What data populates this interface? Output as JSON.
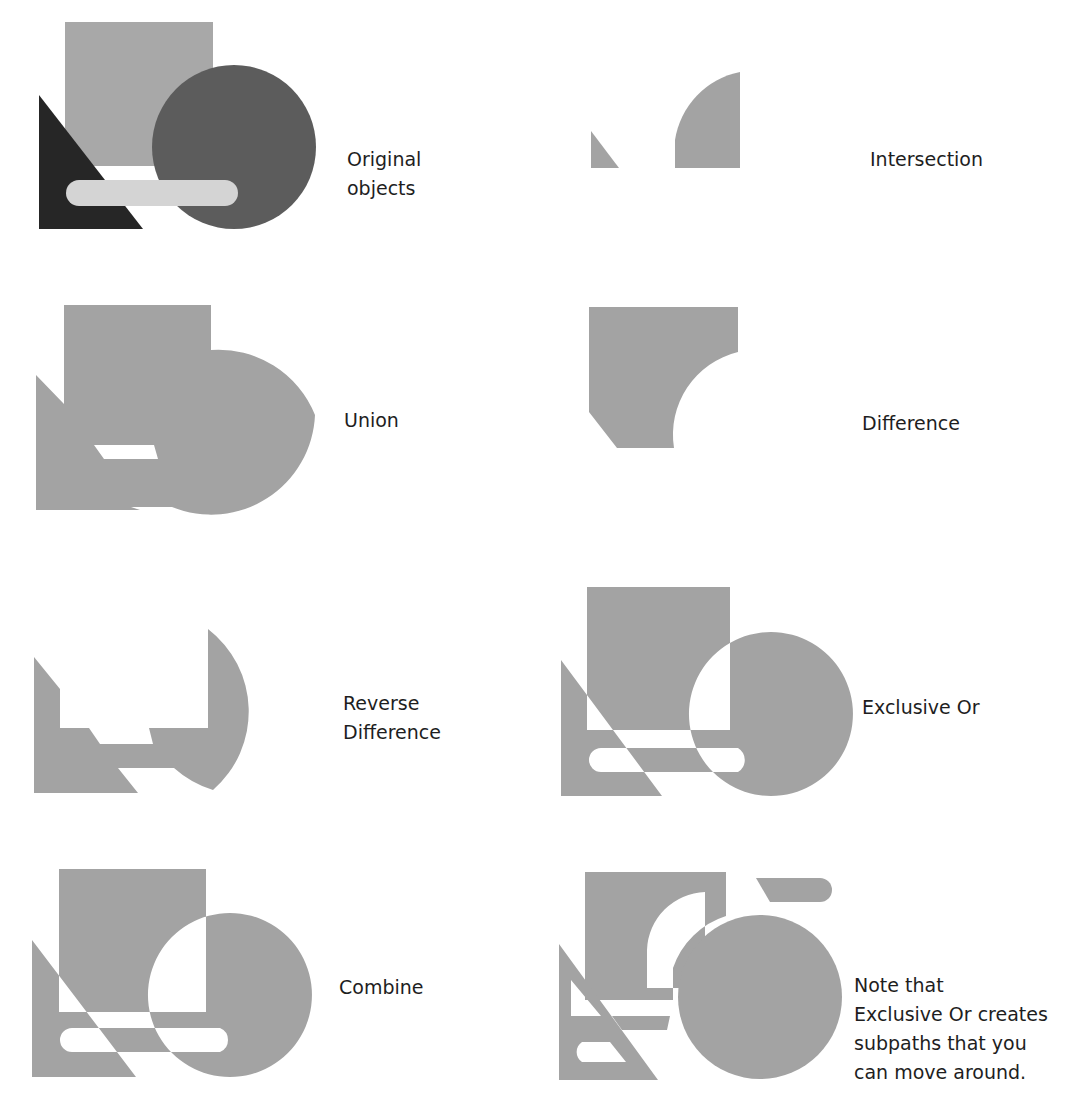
{
  "figure": {
    "type": "pathfinder-operations-illustration",
    "colors": {
      "background": "#ffffff",
      "result_fill": "#a3a3a3",
      "square_original": "#a8a8a8",
      "circle_original": "#5c5c5c",
      "triangle_original": "#262626",
      "bar_original": "#d4d4d4",
      "text": "#1e1e1e"
    },
    "panels": [
      {
        "id": "original",
        "label": "Original objects",
        "label_lines": [
          "Original",
          "objects"
        ]
      },
      {
        "id": "intersection",
        "label": "Intersection",
        "label_lines": [
          "Intersection"
        ]
      },
      {
        "id": "union",
        "label": "Union",
        "label_lines": [
          "Union"
        ]
      },
      {
        "id": "difference",
        "label": "Difference",
        "label_lines": [
          "Difference"
        ]
      },
      {
        "id": "reverse-difference",
        "label": "Reverse Difference",
        "label_lines": [
          "Reverse",
          "Difference"
        ]
      },
      {
        "id": "exclusive-or",
        "label": "Exclusive Or",
        "label_lines": [
          "Exclusive Or"
        ]
      },
      {
        "id": "combine",
        "label": "Combine",
        "label_lines": [
          "Combine"
        ]
      },
      {
        "id": "xor-note",
        "label": "Note that Exclusive Or creates subpaths that you can move around.",
        "label_lines": [
          "Note that",
          "Exclusive Or creates",
          "subpaths that you",
          "can move around."
        ]
      }
    ]
  }
}
